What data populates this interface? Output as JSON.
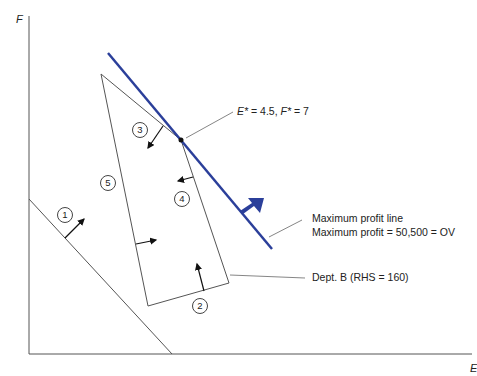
{
  "axes": {
    "y_label": "F",
    "x_label": "E"
  },
  "optimum": {
    "label_e": "E*",
    "value_e": " = 4.5, ",
    "label_f": "F*",
    "value_f": " = 7",
    "E": 4.5,
    "F": 7
  },
  "profit_line": {
    "line1": "Maximum profit line",
    "line2": "Maximum profit = 50,500 = OV",
    "color": "#2b3f9a",
    "max_profit": 50500
  },
  "dept_b": {
    "label": "Dept. B (RHS = 160)",
    "rhs": 160
  },
  "constraints": [
    {
      "id": "1",
      "label": "1"
    },
    {
      "id": "2",
      "label": "2"
    },
    {
      "id": "3",
      "label": "3"
    },
    {
      "id": "4",
      "label": "4"
    },
    {
      "id": "5",
      "label": "5"
    }
  ]
}
